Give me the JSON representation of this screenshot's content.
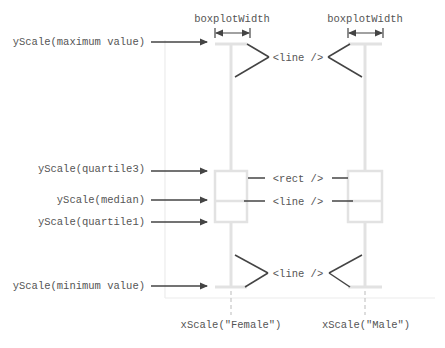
{
  "diagram": {
    "colors": {
      "structure": "#e2e2e2",
      "axis": "#ececec",
      "annotation": "#444444",
      "text": "#555555"
    },
    "width_labels": {
      "female": "boxplotWidth",
      "male": "boxplotWidth"
    },
    "y_labels": {
      "maximum": "yScale(maximum value)",
      "quartile3": "yScale(quartile3)",
      "median": "yScale(median)",
      "quartile1": "yScale(quartile1)",
      "minimum": "yScale(minimum value)"
    },
    "element_labels": {
      "top_whisker": "<line />",
      "box": "<rect />",
      "median_line": "<line />",
      "bottom_whisker": "<line />"
    },
    "x_labels": {
      "female": "xScale(\"Female\")",
      "male": "xScale(\"Male\")"
    },
    "boxplots": [
      {
        "category": "Female",
        "cx": 231,
        "x0": 215,
        "x1": 247
      },
      {
        "category": "Male",
        "cx": 364,
        "x0": 348,
        "x1": 382
      }
    ],
    "y_positions": {
      "maximum": 44,
      "quartile3": 171,
      "median": 201,
      "quartile1": 222,
      "minimum": 287
    }
  }
}
